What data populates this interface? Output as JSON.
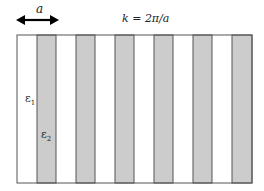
{
  "diagram": {
    "period_label": "a",
    "wavevector_label": "k = 2π/a",
    "epsilon1": {
      "symbol": "ε",
      "sub": "1"
    },
    "epsilon2": {
      "symbol": "ε",
      "sub": "2"
    },
    "colors": {
      "stripe_gray": "#cccccc",
      "stripe_white": "#ffffff",
      "line": "#555555",
      "arrow": "#000000"
    },
    "frame": {
      "left": 17,
      "top": 35,
      "right": 252,
      "bottom": 183
    },
    "gray_stripes": [
      {
        "x0": 37,
        "x1": 56
      },
      {
        "x0": 76,
        "x1": 95
      },
      {
        "x0": 115,
        "x1": 134
      },
      {
        "x0": 154,
        "x1": 173
      },
      {
        "x0": 193,
        "x1": 212
      },
      {
        "x0": 232,
        "x1": 252
      }
    ]
  }
}
